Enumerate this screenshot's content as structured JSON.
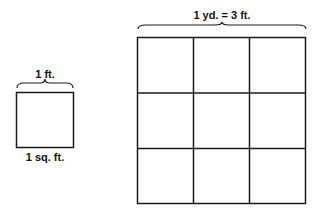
{
  "small_square": {
    "side_label": "1 ft.",
    "area_label": "1 sq. ft."
  },
  "big_square": {
    "side_label": "1 yd. = 3 ft.",
    "grid_rows": 3,
    "grid_cols": 3
  },
  "colors": {
    "line": "#1a1a1a",
    "background": "#ffffff"
  }
}
